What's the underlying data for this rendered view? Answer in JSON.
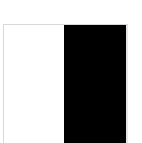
{
  "swatch": {
    "colors": {
      "left": "#ffffff",
      "right": "#000000",
      "border": "#d8d8d8"
    }
  }
}
